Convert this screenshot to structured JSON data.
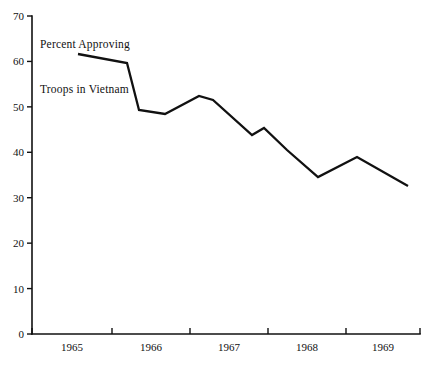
{
  "chart_data": {
    "type": "line",
    "title": "Percent Approving Troops in Vietnam",
    "title_line1": "Percent Approving",
    "title_line2": "Troops in Vietnam",
    "xlabel": "",
    "ylabel": "",
    "ylim": [
      0,
      70
    ],
    "xlim": [
      1964.75,
      1969.9
    ],
    "grid": false,
    "legend": null,
    "yticks": [
      0,
      10,
      20,
      30,
      40,
      50,
      60,
      70
    ],
    "ytick_labels": [
      "0",
      "10",
      "20",
      "30",
      "40",
      "50",
      "60",
      "70"
    ],
    "xtick_labels": [
      "1965",
      "1966",
      "1967",
      "1968",
      "1969"
    ],
    "line_color": "#111111",
    "x": [
      1965.35,
      1965.95,
      1966.1,
      1966.4,
      1966.8,
      1967.0,
      1967.35,
      1967.5,
      1967.85,
      1968.35,
      1968.85,
      1969.5
    ],
    "values": [
      61,
      59,
      49,
      48,
      52,
      51,
      44,
      46,
      41,
      35,
      39,
      32
    ],
    "points": [
      {
        "x": 1965.35,
        "y": 61
      },
      {
        "x": 1965.95,
        "y": 59
      },
      {
        "x": 1966.1,
        "y": 49
      },
      {
        "x": 1966.4,
        "y": 48
      },
      {
        "x": 1966.8,
        "y": 52
      },
      {
        "x": 1967.0,
        "y": 51
      },
      {
        "x": 1967.35,
        "y": 44
      },
      {
        "x": 1967.5,
        "y": 46
      },
      {
        "x": 1967.85,
        "y": 41
      },
      {
        "x": 1968.35,
        "y": 35
      },
      {
        "x": 1968.85,
        "y": 39
      },
      {
        "x": 1969.5,
        "y": 32
      }
    ]
  },
  "geometry": {
    "plot_left": 32,
    "plot_right": 420,
    "plot_bottom": 334,
    "y_top_value": 70,
    "y_top_px": 16,
    "px_per_unit": 4.543,
    "x_tick_px": [
      32,
      112,
      190,
      268,
      346,
      420
    ],
    "x_label_px": [
      72,
      151,
      229,
      307,
      383
    ],
    "series_px": [
      [
        78,
        54
      ],
      [
        127,
        63
      ],
      [
        139,
        110
      ],
      [
        165,
        114
      ],
      [
        199,
        96
      ],
      [
        213,
        100
      ],
      [
        252,
        135
      ],
      [
        264,
        128
      ],
      [
        287,
        150
      ],
      [
        318,
        177
      ],
      [
        357,
        157
      ],
      [
        408,
        186
      ]
    ]
  }
}
